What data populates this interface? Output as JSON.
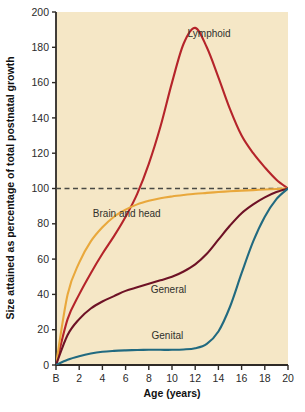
{
  "chart_data": {
    "type": "line",
    "title": "",
    "subtitle": "",
    "xlabel": "Age (years)",
    "ylabel": "Size attained as percentage of total postnatal growth",
    "xlim": [
      0,
      20
    ],
    "ylim": [
      0,
      200
    ],
    "grid": false,
    "legend_position": "inline-annotations",
    "background_color": "#F5E7C6",
    "x_tick_labels": [
      "B",
      "2",
      "4",
      "6",
      "8",
      "10",
      "12",
      "14",
      "16",
      "18",
      "20"
    ],
    "x_tick_values": [
      0,
      2,
      4,
      6,
      8,
      10,
      12,
      14,
      16,
      18,
      20
    ],
    "y_tick_labels": [
      "0",
      "20",
      "40",
      "60",
      "80",
      "100",
      "120",
      "140",
      "160",
      "180",
      "200"
    ],
    "y_tick_values": [
      0,
      20,
      40,
      60,
      80,
      100,
      120,
      140,
      160,
      180,
      200
    ],
    "annotations": [
      {
        "name": "reference-line-100",
        "type": "horizontal-dashed-line",
        "y": 100,
        "color": "#4a4a44",
        "label": ""
      }
    ],
    "x": [
      0,
      1,
      2,
      3,
      4,
      5,
      6,
      7,
      8,
      9,
      10,
      11,
      12,
      13,
      14,
      15,
      16,
      17,
      18,
      19,
      20
    ],
    "series": [
      {
        "name": "Lymphoid",
        "label": "Lymphoid",
        "color": "#B5242A",
        "label_x": 13.2,
        "label_y": 186,
        "values": [
          0,
          26,
          40,
          52,
          63,
          73,
          84,
          97,
          114,
          135,
          160,
          182,
          191,
          180,
          163,
          145,
          130,
          120,
          112,
          105,
          100
        ]
      },
      {
        "name": "Brain and head",
        "label": "Brain and head",
        "color": "#E9A83C",
        "label_x": 6.1,
        "label_y": 84,
        "values": [
          0,
          40,
          58,
          70,
          78,
          84,
          88,
          91,
          93,
          94.5,
          95.5,
          96.3,
          97,
          97.5,
          98,
          98.4,
          98.8,
          99.1,
          99.4,
          99.7,
          100
        ]
      },
      {
        "name": "General",
        "label": "General",
        "color": "#6E1226",
        "label_x": 9.7,
        "label_y": 41,
        "values": [
          0,
          17,
          26,
          32,
          36,
          39,
          42,
          44,
          46,
          48,
          50,
          53,
          57,
          63,
          71,
          79,
          86,
          91,
          95,
          98,
          100
        ]
      },
      {
        "name": "Genital",
        "label": "Genital",
        "color": "#216A80",
        "label_x": 9.6,
        "label_y": 15,
        "values": [
          0,
          3,
          5,
          6.5,
          7.5,
          8,
          8.3,
          8.5,
          8.6,
          8.6,
          8.6,
          8.8,
          9.5,
          12,
          19,
          33,
          52,
          70,
          84,
          94,
          100
        ]
      }
    ]
  }
}
